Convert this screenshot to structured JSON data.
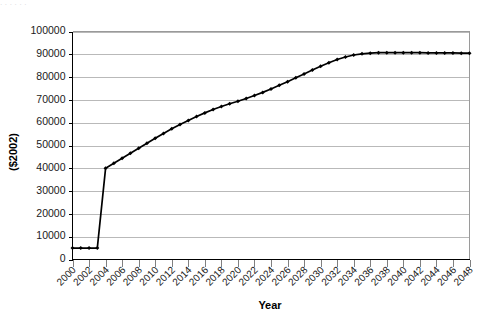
{
  "chart_data": {
    "type": "line",
    "title": "",
    "xlabel": "Year",
    "ylabel": "($2002)",
    "xlim": [
      2000,
      2048
    ],
    "ylim": [
      0,
      100000
    ],
    "ytick_step": 10000,
    "xtick_step": 2,
    "grid": "horizontal",
    "legend": "none",
    "marker": "diamond",
    "line_color": "#000000",
    "grid_color": "#b9b9b9",
    "background": "#ffffff",
    "ytick_labels": [
      "0",
      "10000",
      "20000",
      "30000",
      "40000",
      "50000",
      "60000",
      "70000",
      "80000",
      "90000",
      "100000"
    ],
    "ytick_values": [
      0,
      10000,
      20000,
      30000,
      40000,
      50000,
      60000,
      70000,
      80000,
      90000,
      100000
    ],
    "xtick_labels": [
      "2000",
      "2002",
      "2004",
      "2006",
      "2008",
      "2010",
      "2012",
      "2014",
      "2016",
      "2018",
      "2020",
      "2022",
      "2024",
      "2026",
      "2028",
      "2030",
      "2032",
      "2034",
      "2036",
      "2038",
      "2040",
      "2042",
      "2044",
      "2046",
      "2048"
    ],
    "xtick_values": [
      2000,
      2002,
      2004,
      2006,
      2008,
      2010,
      2012,
      2014,
      2016,
      2018,
      2020,
      2022,
      2024,
      2026,
      2028,
      2030,
      2032,
      2034,
      2036,
      2038,
      2040,
      2042,
      2044,
      2046,
      2048
    ],
    "x": [
      2000,
      2001,
      2002,
      2003,
      2004,
      2005,
      2006,
      2007,
      2008,
      2009,
      2010,
      2011,
      2012,
      2013,
      2014,
      2015,
      2016,
      2017,
      2018,
      2019,
      2020,
      2021,
      2022,
      2023,
      2024,
      2025,
      2026,
      2027,
      2028,
      2029,
      2030,
      2031,
      2032,
      2033,
      2034,
      2035,
      2036,
      2037,
      2038,
      2039,
      2040,
      2041,
      2042,
      2043,
      2044,
      2045,
      2046,
      2047,
      2048
    ],
    "values": [
      5000,
      5000,
      5000,
      5000,
      40000,
      42200,
      44400,
      46600,
      48800,
      51000,
      53200,
      55300,
      57300,
      59200,
      61000,
      62700,
      64300,
      65800,
      67100,
      68300,
      69400,
      70600,
      71900,
      73300,
      74800,
      76400,
      78000,
      79700,
      81400,
      83100,
      84800,
      86300,
      87700,
      88800,
      89700,
      90200,
      90500,
      90700,
      90700,
      90700,
      90700,
      90700,
      90700,
      90600,
      90600,
      90600,
      90600,
      90500,
      90500
    ],
    "series_name": ""
  },
  "ghost_text": ". .              .                    .              .                                             ."
}
